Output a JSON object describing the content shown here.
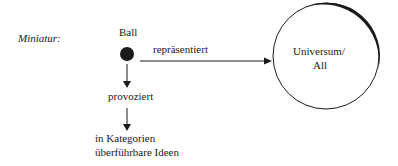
{
  "diagram": {
    "label": "Miniatur:",
    "source_node": "Ball",
    "relation_right": "repräsentiert",
    "target_node_line1": "Universum/",
    "target_node_line2": "All",
    "relation_down": "provoziert",
    "result_line1": "in Kategorien",
    "result_line2": "überführbare Ideen"
  },
  "colors": {
    "ink": "#1a1a1a",
    "background": "#ffffff"
  }
}
